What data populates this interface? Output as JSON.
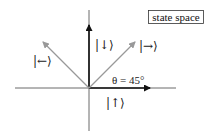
{
  "title_box": {
    "label": "state space"
  },
  "origin": {
    "x": 89,
    "y": 88
  },
  "axes": {
    "horizontal": {
      "x1": 15,
      "x2": 176,
      "y": 88,
      "color": "#333333"
    },
    "vertical": {
      "x": 89,
      "y1": 10,
      "y2": 131,
      "color": "#333333"
    }
  },
  "vectors": [
    {
      "name": "up",
      "label": "|↑⟩",
      "color": "#111111",
      "tip": {
        "x": 150,
        "y": 88
      },
      "label_pos": {
        "x": 106,
        "y": 107
      }
    },
    {
      "name": "down",
      "label": "|↓⟩",
      "color": "#111111",
      "tip": {
        "x": 89,
        "y": 25
      },
      "label_pos": {
        "x": 95,
        "y": 49
      }
    },
    {
      "name": "right",
      "label": "|→⟩",
      "color": "#999999",
      "tip": {
        "x": 135,
        "y": 42
      },
      "label_pos": {
        "x": 139,
        "y": 50
      }
    },
    {
      "name": "left",
      "label": "|←⟩",
      "color": "#999999",
      "tip": {
        "x": 43,
        "y": 42
      },
      "label_pos": {
        "x": 33,
        "y": 65
      }
    }
  ],
  "angle_annotation": {
    "label": "θ = 45°",
    "x": 112,
    "y": 84
  }
}
